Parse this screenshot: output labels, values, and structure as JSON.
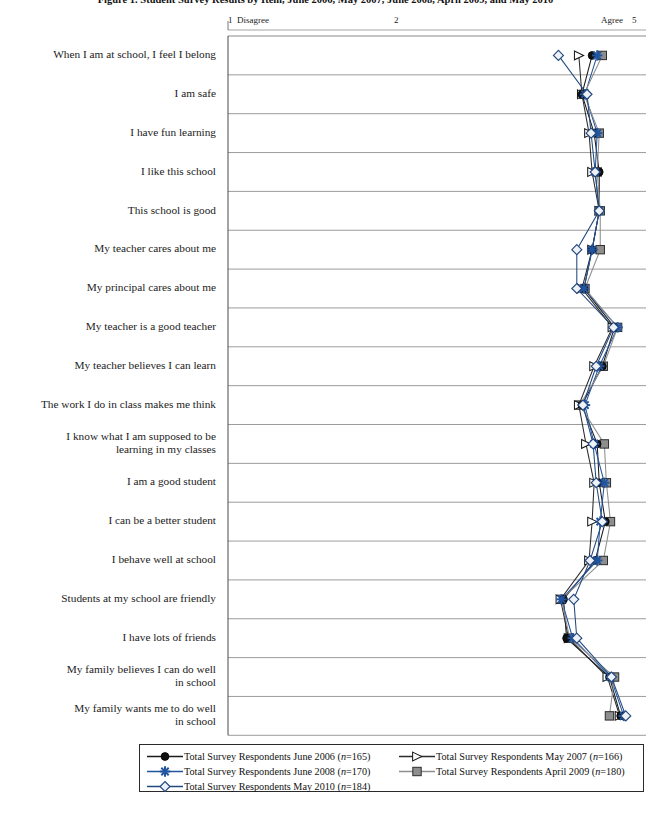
{
  "chart_data": {
    "type": "line",
    "title": "Figure 1. Student Survey Results by Item, June 2006, May 2007, June 2008, April 2009, and May 2010",
    "orientation": "horizontal-categories",
    "xlabel": "",
    "ylabel": "",
    "xlim": [
      1,
      5
    ],
    "grid": true,
    "legend_position": "bottom",
    "axis_ticks": [
      {
        "value": 1,
        "label": "1",
        "annotation": "Disagree"
      },
      {
        "value": 2,
        "label": "2",
        "annotation": ""
      },
      {
        "value": 5,
        "label": "5",
        "annotation": "Agree"
      }
    ],
    "categories": [
      "When I am at school, I feel I belong",
      "I am safe",
      "I have fun learning",
      "I like this school",
      "This school is good",
      "My teacher cares about me",
      "My principal cares about me",
      "My teacher is a good teacher",
      "My teacher believes I can learn",
      "The work I do in class makes me think",
      "I know what I am supposed to be\nlearning in my classes",
      "I am a good student",
      "I can be a better student",
      "I behave well at school",
      "Students at my school are friendly",
      "I have lots of friends",
      "My family believes I can do well\nin school",
      "My family wants me to do well\nin school"
    ],
    "series": [
      {
        "name": "Total Survey Respondents June 2006 (n=165)",
        "label_main": "Total Survey Respondents June 2006 (",
        "label_n": "n",
        "label_tail": "=165)",
        "color": "#1b1b1b",
        "marker": "circle",
        "values": [
          4.55,
          4.45,
          4.57,
          4.62,
          4.62,
          4.55,
          4.47,
          4.77,
          4.65,
          4.45,
          4.6,
          4.62,
          4.68,
          4.58,
          4.27,
          4.3,
          4.72,
          4.83
        ]
      },
      {
        "name": "Total Survey Respondents May 2007 (n=166)",
        "label_main": "Total Survey Respondents May 2007 (",
        "label_n": "n",
        "label_tail": "=166)",
        "color": "#2b2b2b",
        "marker": "triangle",
        "values": [
          4.42,
          4.45,
          4.52,
          4.55,
          4.62,
          4.55,
          4.45,
          4.75,
          4.57,
          4.42,
          4.49,
          4.57,
          4.55,
          4.52,
          4.24,
          4.32,
          4.7,
          4.82
        ]
      },
      {
        "name": "Total Survey Respondents June 2008 (n=170)",
        "label_main": "Total Survey Respondents June 2008 (",
        "label_n": "n",
        "label_tail": "=170)",
        "color": "#2255a0",
        "marker": "star",
        "values": [
          4.6,
          4.48,
          4.6,
          4.58,
          4.62,
          4.55,
          4.47,
          4.8,
          4.62,
          4.48,
          4.57,
          4.67,
          4.63,
          4.6,
          4.25,
          4.36,
          4.73,
          4.86
        ]
      },
      {
        "name": "Total Survey Respondents April 2009 (n=180)",
        "label_main": "Total Survey Respondents April 2009 (",
        "label_n": "n",
        "label_tail": "=180)",
        "color": "#8e8e8e",
        "marker": "square",
        "values": [
          4.65,
          4.47,
          4.62,
          4.6,
          4.63,
          4.63,
          4.48,
          4.8,
          4.66,
          4.43,
          4.67,
          4.69,
          4.73,
          4.66,
          4.25,
          4.33,
          4.77,
          4.72
        ]
      },
      {
        "name": "Total Survey Respondents May 2010 (n=184)",
        "label_main": "Total Survey Respondents May 2010 (",
        "label_n": "n",
        "label_tail": "=184)",
        "color": "#23497f",
        "marker": "diamond",
        "values": [
          4.22,
          4.5,
          4.54,
          4.58,
          4.62,
          4.4,
          4.4,
          4.76,
          4.59,
          4.46,
          4.56,
          4.59,
          4.65,
          4.53,
          4.37,
          4.4,
          4.74,
          4.88
        ]
      }
    ]
  },
  "axis": {
    "left_tick": "1",
    "left_text": "Disagree",
    "mid_tick": "2",
    "right_text": "Agree",
    "right_tick": "5"
  },
  "title": "Figure 1. Student Survey Results by Item, June 2006, May 2007, June 2008, April 2009, and May 2010"
}
